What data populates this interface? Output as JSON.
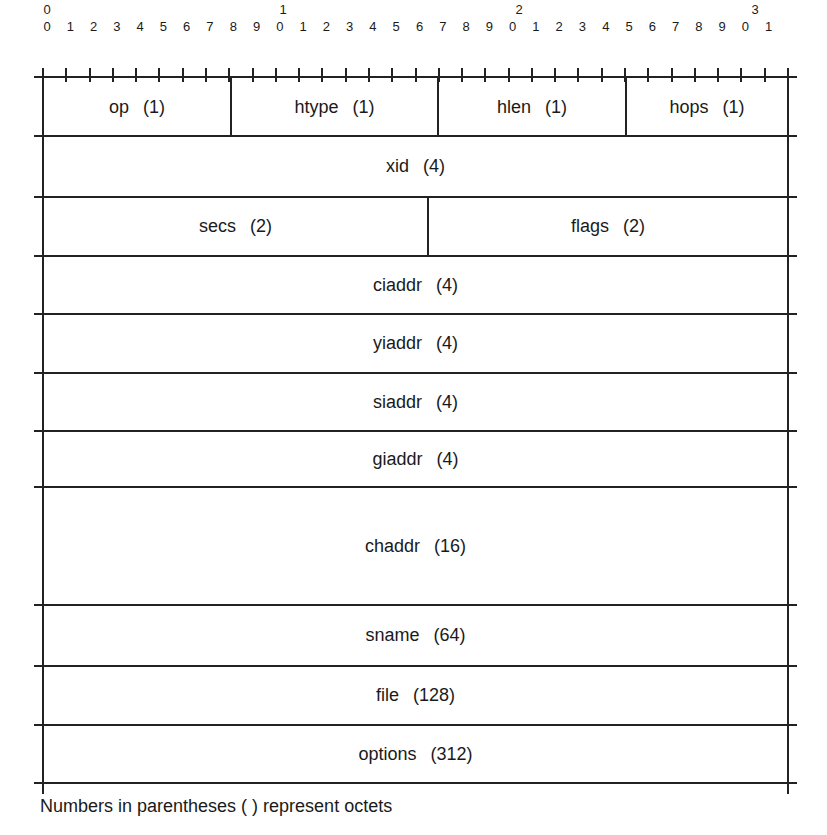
{
  "ruler": {
    "decades": [
      "0",
      "1",
      "2",
      "3"
    ],
    "units": [
      "0",
      "1",
      "2",
      "3",
      "4",
      "5",
      "6",
      "7",
      "8",
      "9",
      "0",
      "1",
      "2",
      "3",
      "4",
      "5",
      "6",
      "7",
      "8",
      "9",
      "0",
      "1",
      "2",
      "3",
      "4",
      "5",
      "6",
      "7",
      "8",
      "9",
      "0",
      "1"
    ]
  },
  "rows": [
    {
      "fields": [
        {
          "name": "op",
          "size": "(1)"
        },
        {
          "name": "htype",
          "size": "(1)"
        },
        {
          "name": "hlen",
          "size": "(1)"
        },
        {
          "name": "hops",
          "size": "(1)"
        }
      ]
    },
    {
      "fields": [
        {
          "name": "xid",
          "size": "(4)"
        }
      ]
    },
    {
      "fields": [
        {
          "name": "secs",
          "size": "(2)"
        },
        {
          "name": "flags",
          "size": "(2)"
        }
      ]
    },
    {
      "fields": [
        {
          "name": "ciaddr",
          "size": "(4)"
        }
      ]
    },
    {
      "fields": [
        {
          "name": "yiaddr",
          "size": "(4)"
        }
      ]
    },
    {
      "fields": [
        {
          "name": "siaddr",
          "size": "(4)"
        }
      ]
    },
    {
      "fields": [
        {
          "name": "giaddr",
          "size": "(4)"
        }
      ]
    },
    {
      "fields": [
        {
          "name": "chaddr",
          "size": "(16)"
        }
      ]
    },
    {
      "fields": [
        {
          "name": "sname",
          "size": "(64)"
        }
      ]
    },
    {
      "fields": [
        {
          "name": "file",
          "size": "(128)"
        }
      ]
    },
    {
      "fields": [
        {
          "name": "options",
          "size": "(312)"
        }
      ]
    }
  ],
  "footnote": "Numbers in parentheses  ( ) represent octets"
}
